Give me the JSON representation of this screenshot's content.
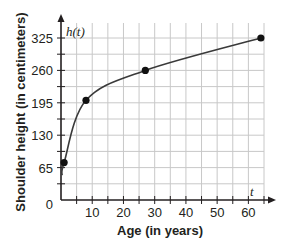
{
  "chart_data": {
    "type": "line",
    "title": "",
    "xlabel": "Age (in years)",
    "ylabel": "Shoulder height (in centimeters)",
    "x_var_label": "t",
    "y_var_label": "h(t)",
    "xlim": [
      0,
      65
    ],
    "ylim": [
      0,
      325
    ],
    "x_ticks": [
      10,
      20,
      30,
      40,
      50,
      60
    ],
    "y_ticks": [
      0,
      65,
      130,
      195,
      260,
      325
    ],
    "x_minor_step": 5,
    "y_minor_step": 32.5,
    "grid": true,
    "legend": "none",
    "series": [
      {
        "name": "h(t)",
        "points": [
          {
            "x": 1,
            "y": 75
          },
          {
            "x": 8,
            "y": 200
          },
          {
            "x": 27,
            "y": 260
          },
          {
            "x": 64,
            "y": 325
          }
        ]
      }
    ]
  },
  "colors": {
    "grid": "#c8c8c8",
    "axis": "#231f20",
    "curve": "#3a3a3a",
    "point": "#111111"
  }
}
